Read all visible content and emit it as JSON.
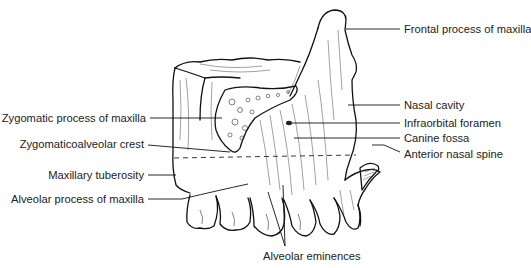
{
  "figure": {
    "labels": {
      "frontal_process": "Frontal process of maxilla",
      "zygomatic_process": "Zygomatic process of maxilla",
      "nasal_cavity": "Nasal cavity",
      "infraorbital_foramen": "Infraorbital foramen",
      "zygomaticoalveolar_crest": "Zygomaticoalveolar crest",
      "canine_fossa": "Canine fossa",
      "anterior_nasal_spine": "Anterior nasal spine",
      "maxillary_tuberosity": "Maxillary tuberosity",
      "alveolar_process": "Alveolar process of maxilla",
      "alveolar_eminences": "Alveolar eminences"
    },
    "colors": {
      "ink": "#111111",
      "background": "#ffffff",
      "text": "#222222"
    }
  }
}
